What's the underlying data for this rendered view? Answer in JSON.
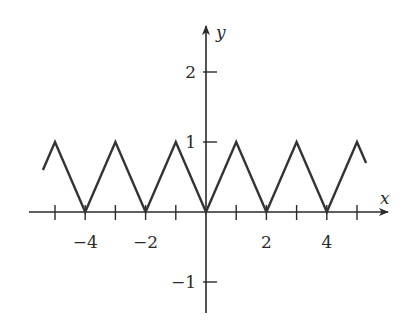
{
  "chart_data": {
    "type": "line",
    "title": "",
    "xlabel": "x",
    "ylabel": "y",
    "xlim": [
      -5.3,
      5.3
    ],
    "ylim": [
      -1.4,
      2.6
    ],
    "grid": false,
    "x_ticks": [
      -5,
      -4,
      -3,
      -2,
      -1,
      0,
      1,
      2,
      3,
      4,
      5
    ],
    "x_tick_labels": [
      {
        "value": -4,
        "label": "−4"
      },
      {
        "value": -2,
        "label": "−2"
      },
      {
        "value": 2,
        "label": "2"
      },
      {
        "value": 4,
        "label": "4"
      }
    ],
    "y_tick_labels": [
      {
        "value": 2,
        "label": "2"
      },
      {
        "value": 1,
        "label": "1"
      },
      {
        "value": -1,
        "label": "−1"
      }
    ],
    "series": [
      {
        "name": "triangle wave",
        "description": "Periodic triangle wave with period 2: y = |x| on [-1,1], extended periodically",
        "x": [
          -5.4,
          -5,
          -4,
          -3,
          -2,
          -1,
          0,
          1,
          2,
          3,
          4,
          5,
          5.3
        ],
        "y": [
          0.6,
          1,
          0,
          1,
          0,
          1,
          0,
          1,
          0,
          1,
          0,
          1,
          0.7
        ]
      }
    ]
  }
}
